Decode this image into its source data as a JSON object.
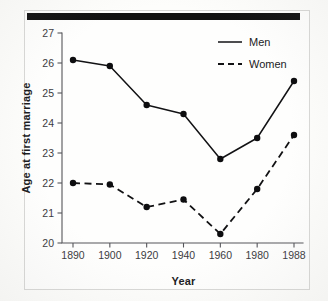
{
  "figure": {
    "background_color": "#fdfdfb",
    "frame_color": "#d8d8d6",
    "rule_color": "#111111",
    "ink_color": "#121214"
  },
  "chart_data": {
    "type": "line",
    "title": "",
    "xlabel": "Year",
    "ylabel": "Age at first marriage",
    "categories": [
      "1890",
      "1900",
      "1920",
      "1940",
      "1960",
      "1980",
      "1988"
    ],
    "x_tick_labels": [
      "1890",
      "1900",
      "1920",
      "1940",
      "1960",
      "1980",
      "1988"
    ],
    "y_tick_labels": [
      "20",
      "21",
      "22",
      "23",
      "24",
      "25",
      "26",
      "27"
    ],
    "y_ticks": [
      20,
      21,
      22,
      23,
      24,
      25,
      26,
      27
    ],
    "ylim": [
      20,
      27
    ],
    "grid": false,
    "legend_position": "top-right",
    "series": [
      {
        "name": "Men",
        "line_style": "solid",
        "marker": "filled-circle",
        "values": [
          26.1,
          25.9,
          24.6,
          24.3,
          22.8,
          23.5,
          25.4
        ]
      },
      {
        "name": "Women",
        "line_style": "dashed",
        "marker": "filled-circle",
        "values": [
          22.0,
          21.95,
          21.2,
          21.45,
          20.3,
          21.8,
          23.6
        ]
      }
    ]
  },
  "legend": {
    "entries": [
      {
        "label": "Men",
        "style": "solid"
      },
      {
        "label": "Women",
        "style": "dashed"
      }
    ]
  }
}
